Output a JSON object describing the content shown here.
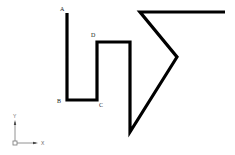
{
  "diagram": {
    "stroke_color": "#000000",
    "stroke_width": 3.2,
    "path_points": [
      [
        67,
        13
      ],
      [
        67,
        100
      ],
      [
        97,
        100
      ],
      [
        97,
        42
      ],
      [
        130,
        42
      ],
      [
        130,
        132
      ],
      [
        177,
        57
      ],
      [
        140,
        12
      ],
      [
        225,
        12
      ]
    ],
    "labels": [
      {
        "text": "A",
        "x": 60,
        "y": 11
      },
      {
        "text": "B",
        "x": 57,
        "y": 103
      },
      {
        "text": "C",
        "x": 99,
        "y": 107
      },
      {
        "text": "D",
        "x": 91,
        "y": 37
      }
    ]
  },
  "ucs_icon": {
    "icon": "ucs-axis-icon",
    "color": "#777777",
    "x_label": "X",
    "y_label": "Y"
  }
}
